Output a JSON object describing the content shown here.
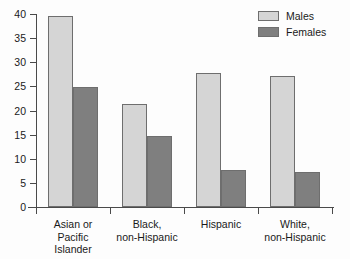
{
  "chart_data": {
    "type": "bar",
    "title": "",
    "subtitle": "",
    "xlabel": "",
    "ylabel": "",
    "ylim": [
      0,
      40
    ],
    "yticks": [
      0,
      5,
      10,
      15,
      20,
      25,
      30,
      35,
      40
    ],
    "ytick_labels": [
      "0",
      "5",
      "10",
      "15",
      "20",
      "25",
      "30",
      "35",
      "40"
    ],
    "grid": false,
    "legend_position": "top-right",
    "categories": [
      "Asian or\nPacific\nIslander",
      "Black,\nnon-Hispanic",
      "Hispanic",
      "White,\nnon-Hispanic"
    ],
    "series": [
      {
        "name": "Males",
        "color": "#d5d5d5",
        "values": [
          39.5,
          21.3,
          27.7,
          27.1
        ]
      },
      {
        "name": "Females",
        "color": "#7f7f7f",
        "values": [
          24.9,
          14.7,
          7.6,
          7.2
        ]
      }
    ]
  },
  "legend": {
    "items": [
      {
        "label": "Males",
        "color": "#d5d5d5"
      },
      {
        "label": "Females",
        "color": "#7f7f7f"
      }
    ]
  },
  "axes": {
    "y": {
      "labels": [
        "40",
        "35",
        "30",
        "25",
        "20",
        "15",
        "10",
        "5",
        "0"
      ]
    },
    "x": {
      "labels": [
        "Asian or\nPacific\nIslander",
        "Black,\nnon-Hispanic",
        "Hispanic",
        "White,\nnon-Hispanic"
      ]
    }
  }
}
